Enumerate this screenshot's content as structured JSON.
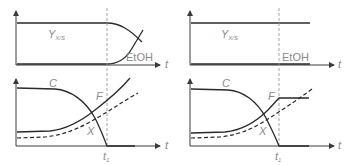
{
  "diagram": {
    "title": "",
    "colors": {
      "curve": "#2a2a2a",
      "axis": "#3a3a3a",
      "label": "#8a8a8a",
      "dashed_ref": "#9a9a9a"
    },
    "panels": [
      {
        "id": "left",
        "top_plot": {
          "labels": {
            "yield": "Y",
            "yield_sub": "X/S",
            "ethanol": "EtOH",
            "time_axis": "t"
          }
        },
        "bottom_plot": {
          "labels": {
            "substrate": "C",
            "feed": "F",
            "biomass": "X",
            "time_axis": "t",
            "t1": "t",
            "t1_sub": "1"
          }
        }
      },
      {
        "id": "right",
        "top_plot": {
          "labels": {
            "yield": "Y",
            "yield_sub": "X/S",
            "ethanol": "EtOH",
            "time_axis": "t"
          }
        },
        "bottom_plot": {
          "labels": {
            "substrate": "C",
            "feed": "F",
            "biomass": "X",
            "time_axis": "t",
            "t1": "t",
            "t1_sub": "1"
          }
        }
      }
    ]
  }
}
